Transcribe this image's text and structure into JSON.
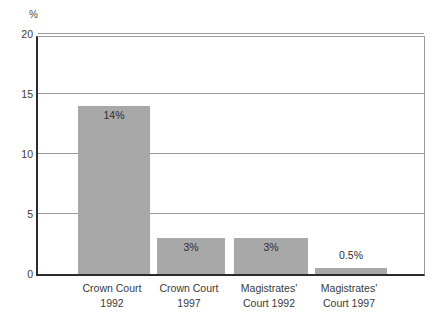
{
  "chart_data": {
    "type": "bar",
    "title": "",
    "subtitle": "",
    "xlabel": "",
    "ylabel": "%",
    "axis_unit": "%",
    "ylim": [
      0,
      20
    ],
    "yticks": [
      "0",
      "5",
      "10",
      "15",
      "20"
    ],
    "ytick_values": [
      0,
      5,
      10,
      15,
      20
    ],
    "grid": "horizontal",
    "legend": "none",
    "categories": [
      "Crown Court 1992",
      "Crown Court 1997",
      "Magistrates' Court 1992",
      "Magistrates' Court 1997"
    ],
    "category_lines": [
      {
        "line1": "Crown Court",
        "line2": "1992"
      },
      {
        "line1": "Crown Court",
        "line2": "1997"
      },
      {
        "line1": "Magistrates'",
        "line2": "Court 1992"
      },
      {
        "line1": "Magistrates'",
        "line2": "Court 1997"
      }
    ],
    "values": [
      14,
      3,
      3,
      0.5
    ],
    "value_labels": [
      "14%",
      "3%",
      "3%",
      "0.5%"
    ],
    "bar_color": "#a8a8a8",
    "gridline_color": "#9a9a9a",
    "axis_color": "#2b2b2b",
    "background_color": "#ffffff",
    "text_color": "#3a3a3a"
  }
}
